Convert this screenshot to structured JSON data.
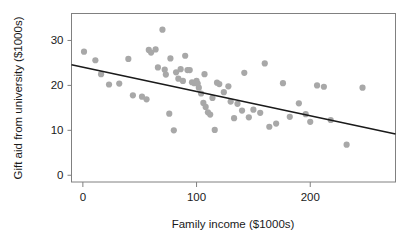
{
  "chart_data": {
    "type": "scatter",
    "title": "",
    "xlabel": "Family income ($1000s)",
    "ylabel": "Gift aid from university ($1000s)",
    "xlim": [
      -10,
      275
    ],
    "ylim": [
      -1.5,
      36
    ],
    "xticks": [
      0,
      100,
      200
    ],
    "xtick_labels": [
      "0",
      "100",
      "200"
    ],
    "yticks": [
      0,
      10,
      20,
      30
    ],
    "ytick_labels": [
      "0",
      "10",
      "20",
      "30"
    ],
    "grid": false,
    "legend": null,
    "point_color": "#a8a8a8",
    "line_color": "#1a1a1a",
    "frame_color": "#808080",
    "series": [
      {
        "name": "Gift aid vs family income",
        "x": [
          1,
          11,
          16,
          23,
          32,
          40,
          44,
          52,
          56,
          58,
          60,
          64,
          66,
          70,
          72,
          73,
          76,
          77,
          80,
          82,
          84,
          86,
          88,
          90,
          92,
          94,
          96,
          98,
          100,
          101,
          102,
          104,
          106,
          107,
          108,
          110,
          112,
          114,
          116,
          118,
          120,
          124,
          128,
          130,
          133,
          136,
          140,
          142,
          146,
          150,
          156,
          160,
          164,
          170,
          176,
          182,
          190,
          196,
          200,
          206,
          212,
          218,
          232,
          246
        ],
        "y": [
          27.5,
          25.6,
          22.5,
          20.2,
          20.4,
          25.9,
          17.8,
          17.5,
          16.9,
          27.9,
          27.3,
          28.0,
          24.0,
          32.4,
          23.5,
          22.4,
          13.7,
          26.0,
          10.0,
          22.9,
          21.5,
          23.6,
          21.0,
          26.6,
          23.4,
          23.4,
          20.7,
          20.5,
          21.0,
          20.4,
          19.5,
          18.2,
          16.1,
          22.5,
          15.2,
          14.0,
          13.5,
          17.2,
          10.1,
          20.6,
          20.3,
          18.5,
          19.8,
          16.4,
          12.7,
          15.9,
          14.4,
          22.8,
          12.9,
          14.6,
          13.9,
          24.9,
          10.8,
          11.5,
          20.5,
          13.0,
          16.0,
          13.6,
          11.9,
          20.0,
          19.7,
          12.3,
          6.8,
          19.5
        ]
      }
    ],
    "trend_line": {
      "name": "least-squares regression line",
      "x_start": -10,
      "y_start": 24.6,
      "x_end": 275,
      "y_end": 9.2
    }
  }
}
